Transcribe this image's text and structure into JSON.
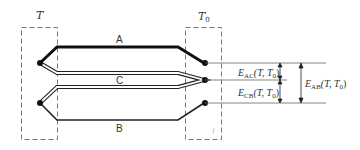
{
  "zones": {
    "hot": {
      "label": "T"
    },
    "cold": {
      "label": "T",
      "subscript": "0"
    }
  },
  "wires": {
    "A": {
      "label": "A",
      "style": "thick"
    },
    "C": {
      "label": "C",
      "style": "double"
    },
    "B": {
      "label": "B",
      "style": "normal"
    }
  },
  "emfs": {
    "ac": {
      "E": "E",
      "sub": "AC",
      "args": "(T, T",
      "args_sub": "0",
      "close": ")"
    },
    "cb": {
      "E": "E",
      "sub": "CB",
      "args": "(T, T",
      "args_sub": "0",
      "close": ")"
    },
    "ab": {
      "E": "E",
      "sub": "AB",
      "args": "(T, T",
      "args_sub": "0",
      "close": ")"
    }
  },
  "colors": {
    "line": "#222222",
    "dash": "#777777",
    "thin": "#666666"
  }
}
